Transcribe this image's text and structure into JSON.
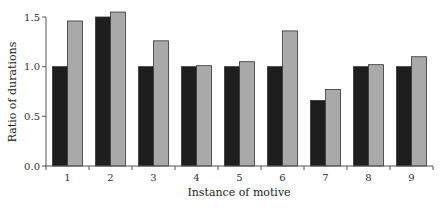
{
  "chart_data": {
    "type": "bar",
    "title": "",
    "xlabel": "Instance of motive",
    "ylabel": "Ratio of durations",
    "categories": [
      "1",
      "2",
      "3",
      "4",
      "5",
      "6",
      "7",
      "8",
      "9"
    ],
    "series": [
      {
        "name": "Series A (dark)",
        "color": "#1e1e1e",
        "values": [
          1.0,
          1.5,
          1.0,
          1.0,
          1.0,
          1.0,
          0.66,
          1.0,
          1.0
        ]
      },
      {
        "name": "Series B (grey)",
        "color": "#a9a9a9",
        "values": [
          1.46,
          1.55,
          1.26,
          1.01,
          1.05,
          1.36,
          0.77,
          1.02,
          1.1
        ]
      }
    ],
    "yticks": [
      "0.0",
      "0.5",
      "1.0",
      "1.5"
    ],
    "ylim": [
      0,
      1.5
    ],
    "grid": false,
    "legend": "none"
  }
}
